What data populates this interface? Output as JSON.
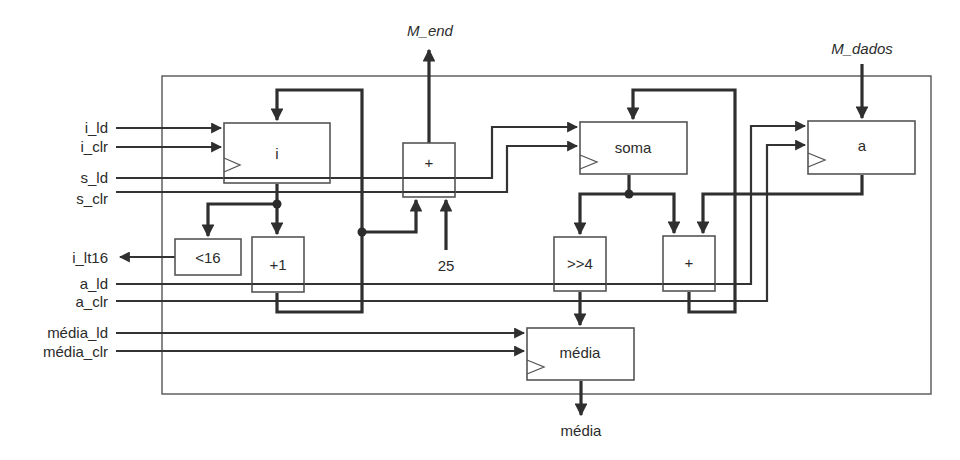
{
  "external_outputs": {
    "m_end": "M_end",
    "m_dados": "M_dados",
    "media_out": "média"
  },
  "control_inputs": [
    {
      "id": "i_ld",
      "label": "i_ld"
    },
    {
      "id": "i_clr",
      "label": "i_clr"
    },
    {
      "id": "s_ld",
      "label": "s_ld"
    },
    {
      "id": "s_clr",
      "label": "s_clr"
    },
    {
      "id": "a_ld",
      "label": "a_ld"
    },
    {
      "id": "a_clr",
      "label": "a_clr"
    },
    {
      "id": "media_ld",
      "label": "média_ld"
    },
    {
      "id": "media_clr",
      "label": "média_clr"
    }
  ],
  "status_outputs": [
    {
      "id": "i_lt16",
      "label": "i_lt16"
    }
  ],
  "registers": {
    "i": "i",
    "soma": "soma",
    "a": "a",
    "media": "média"
  },
  "units": {
    "addr_adder": "+",
    "comparator": "<16",
    "incrementer": "+1",
    "shifter": ">>4",
    "sum_adder": "+"
  },
  "constants": {
    "base_address": "25"
  },
  "colors": {
    "wire": "#2f2f2f",
    "box_stroke": "#555555",
    "background": "#ffffff"
  }
}
